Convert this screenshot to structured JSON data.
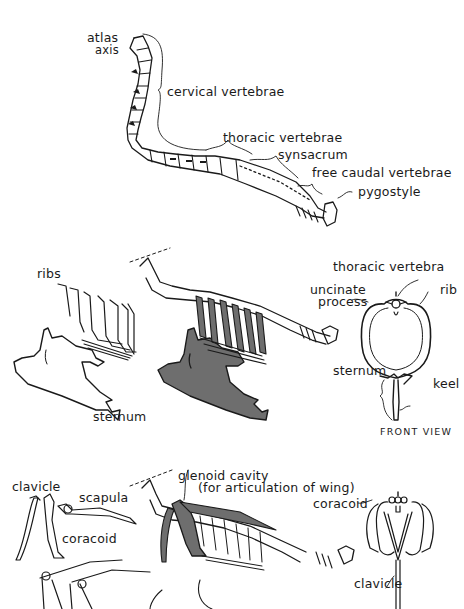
{
  "colors": {
    "ink": "#1a1a1a",
    "shade": "#6e6e6e",
    "paper": "#ffffff"
  },
  "panel_top": {
    "title": "vertebral column (lateral view)",
    "labels": {
      "atlas": "atlas",
      "axis": "axis",
      "cervical": "cervical vertebrae",
      "thoracic": "thoracic vertebrae",
      "synsacrum": "synsacrum",
      "free_caudal": "free caudal vertebrae",
      "pygostyle": "pygostyle"
    }
  },
  "panel_middle": {
    "labels": {
      "ribs": "ribs",
      "sternum_left": "sternum",
      "thoracic_vertebra": "thoracic vertebra",
      "uncinate_1": "uncinate",
      "uncinate_2": "process",
      "rib": "rib",
      "sternum_right": "sternum",
      "keel": "keel",
      "front_view": "FRONT VIEW"
    }
  },
  "panel_bottom": {
    "labels": {
      "clavicle_left": "clavicle",
      "scapula": "scapula",
      "coracoid_left": "coracoid",
      "glenoid_1": "glenoid cavity",
      "glenoid_2": "(for articulation of wing)",
      "coracoid_right": "coracoid",
      "clavicle_right": "clavicle"
    }
  }
}
